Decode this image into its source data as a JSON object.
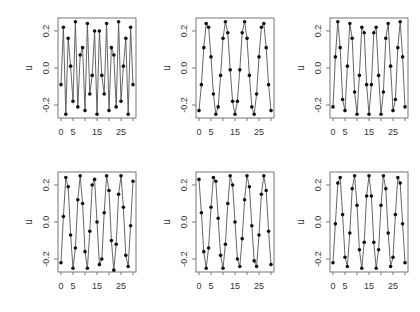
{
  "figure": {
    "layout": {
      "rows": 2,
      "cols": 3
    },
    "colors": {
      "line": "#555555",
      "point": "#111111",
      "frame": "#777777",
      "text": "#333333"
    }
  },
  "chart_data": [
    {
      "type": "line",
      "panel": 1,
      "xlabel": "",
      "ylabel": "u",
      "xticks": [
        0,
        5,
        15,
        25
      ],
      "yticks": [
        "-0.2",
        "0.0",
        "0.2"
      ],
      "xlim": [
        0,
        30
      ],
      "ylim": [
        -0.27,
        0.27
      ],
      "markers": true,
      "x": [
        0,
        1,
        2,
        3,
        4,
        5,
        6,
        7,
        8,
        9,
        10,
        11,
        12,
        13,
        14,
        15,
        16,
        17,
        18,
        19,
        20,
        21,
        22,
        23,
        24,
        25,
        26,
        27,
        28,
        29,
        30
      ],
      "values": [
        -0.09,
        0.22,
        -0.25,
        0.16,
        0.01,
        -0.18,
        0.25,
        -0.21,
        0.07,
        0.11,
        -0.23,
        0.24,
        -0.14,
        -0.04,
        0.2,
        -0.25,
        0.2,
        -0.04,
        -0.14,
        0.24,
        -0.23,
        0.11,
        0.07,
        -0.21,
        0.25,
        -0.18,
        0.01,
        0.16,
        -0.25,
        0.22,
        -0.09
      ]
    },
    {
      "type": "line",
      "panel": 2,
      "xlabel": "",
      "ylabel": "u",
      "xticks": [
        0,
        5,
        15,
        25
      ],
      "yticks": [
        "-0.2",
        "0.0",
        "0.2"
      ],
      "xlim": [
        0,
        30
      ],
      "ylim": [
        -0.27,
        0.27
      ],
      "markers": true,
      "x": [
        0,
        1,
        2,
        3,
        4,
        5,
        6,
        7,
        8,
        9,
        10,
        11,
        12,
        13,
        14,
        15,
        16,
        17,
        18,
        19,
        20,
        21,
        22,
        23,
        24,
        25,
        26,
        27,
        28,
        29,
        30
      ],
      "values": [
        -0.23,
        -0.09,
        0.11,
        0.24,
        0.22,
        0.06,
        -0.14,
        -0.25,
        -0.21,
        -0.04,
        0.16,
        0.25,
        0.19,
        -0.01,
        -0.18,
        -0.25,
        -0.18,
        -0.01,
        0.19,
        0.25,
        0.16,
        -0.04,
        -0.21,
        -0.25,
        -0.14,
        0.06,
        0.22,
        0.24,
        0.11,
        -0.09,
        -0.23
      ]
    },
    {
      "type": "line",
      "panel": 3,
      "xlabel": "",
      "ylabel": "u",
      "xticks": [
        0,
        5,
        15,
        25
      ],
      "yticks": [
        "-0.2",
        "0.0",
        "0.2"
      ],
      "xlim": [
        0,
        30
      ],
      "ylim": [
        -0.27,
        0.27
      ],
      "markers": true,
      "x": [
        0,
        1,
        2,
        3,
        4,
        5,
        6,
        7,
        8,
        9,
        10,
        11,
        12,
        13,
        14,
        15,
        16,
        17,
        18,
        19,
        20,
        21,
        22,
        23,
        24,
        25,
        26,
        27,
        28,
        29,
        30
      ],
      "values": [
        -0.21,
        0.06,
        0.25,
        0.11,
        -0.17,
        -0.23,
        0.01,
        0.24,
        0.16,
        -0.13,
        -0.25,
        -0.04,
        0.22,
        0.19,
        -0.09,
        -0.25,
        -0.09,
        0.19,
        0.22,
        -0.04,
        -0.25,
        -0.13,
        0.16,
        0.24,
        0.01,
        -0.23,
        -0.17,
        0.11,
        0.25,
        0.06,
        -0.21
      ]
    },
    {
      "type": "line",
      "panel": 4,
      "xlabel": "",
      "ylabel": "u",
      "xticks": [
        0,
        5,
        15,
        25
      ],
      "yticks": [
        "-0.2",
        "0.0",
        "0.2"
      ],
      "xlim": [
        0,
        30
      ],
      "ylim": [
        -0.27,
        0.27
      ],
      "markers": true,
      "x": [
        0,
        1,
        2,
        3,
        4,
        5,
        6,
        7,
        8,
        9,
        10,
        11,
        12,
        13,
        14,
        15,
        16,
        17,
        18,
        19,
        20,
        21,
        22,
        23,
        24,
        25,
        26,
        27,
        28,
        29,
        30
      ],
      "values": [
        -0.22,
        0.03,
        0.24,
        0.19,
        -0.07,
        -0.25,
        -0.14,
        0.12,
        0.25,
        0.1,
        -0.16,
        -0.25,
        -0.05,
        0.2,
        0.23,
        0.0,
        -0.23,
        -0.2,
        0.05,
        0.25,
        0.17,
        -0.1,
        -0.26,
        -0.12,
        0.15,
        0.25,
        0.08,
        -0.18,
        -0.24,
        -0.02,
        0.22
      ]
    },
    {
      "type": "line",
      "panel": 5,
      "xlabel": "",
      "ylabel": "u",
      "xticks": [
        0,
        5,
        15,
        25
      ],
      "yticks": [
        "-0.2",
        "0.0",
        "0.2"
      ],
      "xlim": [
        0,
        30
      ],
      "ylim": [
        -0.27,
        0.27
      ],
      "markers": true,
      "x": [
        0,
        1,
        2,
        3,
        4,
        5,
        6,
        7,
        8,
        9,
        10,
        11,
        12,
        13,
        14,
        15,
        16,
        17,
        18,
        19,
        20,
        21,
        22,
        23,
        24,
        25,
        26,
        27,
        28,
        29,
        30
      ],
      "values": [
        0.23,
        0.05,
        -0.16,
        -0.25,
        -0.14,
        0.08,
        0.24,
        0.22,
        0.02,
        -0.18,
        -0.25,
        -0.12,
        0.1,
        0.25,
        0.2,
        0.0,
        -0.2,
        -0.24,
        -0.09,
        0.12,
        0.25,
        0.19,
        -0.02,
        -0.21,
        -0.24,
        -0.07,
        0.15,
        0.25,
        0.17,
        -0.05,
        -0.23
      ]
    },
    {
      "type": "line",
      "panel": 6,
      "xlabel": "",
      "ylabel": "u",
      "xticks": [
        0,
        5,
        15,
        25
      ],
      "yticks": [
        "-0.2",
        "0.0",
        "0.2"
      ],
      "xlim": [
        0,
        30
      ],
      "ylim": [
        -0.27,
        0.27
      ],
      "markers": true,
      "x": [
        0,
        1,
        2,
        3,
        4,
        5,
        6,
        7,
        8,
        9,
        10,
        11,
        12,
        13,
        14,
        15,
        16,
        17,
        18,
        19,
        20,
        21,
        22,
        23,
        24,
        25,
        26,
        27,
        28,
        29,
        30
      ],
      "values": [
        -0.22,
        -0.01,
        0.21,
        0.24,
        0.04,
        -0.19,
        -0.24,
        -0.06,
        0.18,
        0.25,
        0.09,
        -0.15,
        -0.25,
        -0.11,
        0.14,
        0.25,
        0.14,
        -0.11,
        -0.25,
        -0.15,
        0.09,
        0.25,
        0.18,
        -0.06,
        -0.24,
        -0.19,
        0.04,
        0.24,
        0.21,
        -0.01,
        -0.22
      ]
    }
  ]
}
